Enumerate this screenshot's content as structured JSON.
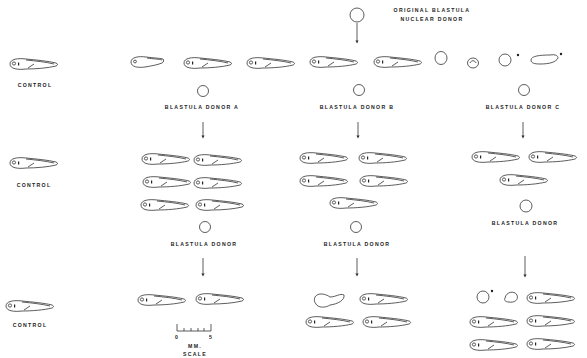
{
  "figure": {
    "title_label": {
      "line1": "ORIGINAL BLASTULA",
      "line2": "NUCLEAR DONOR"
    },
    "colors": {
      "ink": "#222222",
      "background": "#ffffff"
    },
    "rows": [
      {
        "control_label": "CONTROL"
      },
      {
        "control_label": "CONTROL"
      },
      {
        "control_label": "CONTROL"
      }
    ],
    "donors": {
      "a": {
        "label": "BLASTULA DONOR A",
        "sub_label": "BLASTULA DONOR"
      },
      "b": {
        "label": "BLASTULA DONOR B",
        "sub_label": "BLASTULA DONOR"
      },
      "c": {
        "label": "BLASTULA DONOR C",
        "sub_label": "BLASTULA DONOR"
      }
    },
    "scale_bar": {
      "tick_start": "0",
      "tick_end": "5",
      "unit": "MM.",
      "caption": "SCALE"
    }
  }
}
